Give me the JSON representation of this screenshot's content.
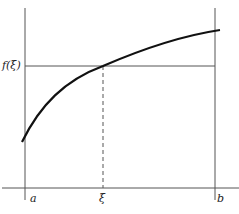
{
  "diagram": {
    "labels": {
      "y_label": "f(ξ)",
      "a": "a",
      "xi": "ξ",
      "b": "b"
    },
    "colors": {
      "line": "#555555",
      "curve": "#111111"
    }
  }
}
